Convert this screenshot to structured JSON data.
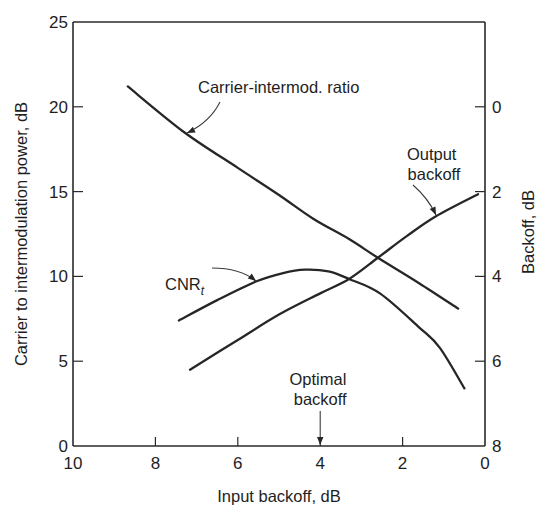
{
  "chart_data": {
    "type": "line",
    "title": "",
    "xlabel": "Input backoff, dB",
    "ylabel": "Carrier to intermodulation power, dB",
    "y2label": "Backoff, dB",
    "xlim": [
      10,
      0
    ],
    "ylim": [
      0,
      25
    ],
    "y2lim": [
      8,
      0
    ],
    "x_ticks": [
      10,
      8,
      6,
      4,
      2,
      0
    ],
    "y_ticks": [
      0,
      5,
      10,
      15,
      20,
      25
    ],
    "y2_ticks": [
      0,
      2,
      4,
      6,
      8
    ],
    "grid": false,
    "legend": "none (inline annotations)",
    "series": [
      {
        "name": "Carrier-intermod. ratio",
        "axis": "left",
        "x": [
          8.67,
          7.3,
          6.0,
          5.0,
          4.17,
          3.3,
          2.6,
          1.6,
          0.65
        ],
        "y": [
          21.2,
          18.5,
          16.4,
          14.8,
          13.4,
          12.2,
          11.1,
          9.6,
          8.1
        ]
      },
      {
        "name": "CNR_t",
        "axis": "left",
        "x": [
          7.43,
          6.5,
          5.56,
          4.9,
          4.37,
          3.8,
          3.3,
          2.55,
          1.6,
          1.1,
          0.5
        ],
        "y": [
          7.4,
          8.6,
          9.7,
          10.2,
          10.4,
          10.3,
          9.85,
          9.0,
          7.0,
          5.8,
          3.4
        ]
      },
      {
        "name": "Output backoff",
        "axis": "right",
        "x": [
          7.16,
          6.0,
          5.0,
          4.0,
          3.3,
          2.6,
          1.9,
          1.19,
          0.17
        ],
        "y": [
          6.2,
          5.5,
          4.9,
          4.4,
          4.06,
          3.56,
          3.05,
          2.58,
          2.06
        ]
      }
    ],
    "annotations": [
      {
        "text": "Carrier-intermod. ratio",
        "points_to_series": "Carrier-intermod. ratio",
        "at_x": 7.3
      },
      {
        "text_main": "CNR",
        "text_sub": "t",
        "points_to_series": "CNR_t",
        "at_x": 5.56
      },
      {
        "text_lines": [
          "Output",
          "backoff"
        ],
        "points_to_series": "Output backoff",
        "at_x": 1.19
      },
      {
        "text_lines": [
          "Optimal",
          "backoff"
        ],
        "points_to_x": 4.0
      }
    ]
  }
}
